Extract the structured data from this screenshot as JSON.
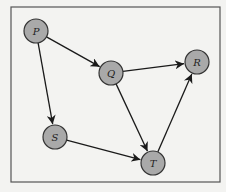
{
  "diagram": {
    "type": "directed-graph",
    "frame": {
      "x": 11,
      "y": 7,
      "width": 209,
      "height": 175,
      "stroke": "#555555"
    },
    "style": {
      "node_fill": "#a9a9a9",
      "node_stroke": "#333333",
      "edge_color": "#1a1a1a",
      "background": "#f3f3f1",
      "node_radius": 12
    },
    "nodes": [
      {
        "id": "P",
        "label": "P",
        "x": 36,
        "y": 31
      },
      {
        "id": "Q",
        "label": "Q",
        "x": 111,
        "y": 73
      },
      {
        "id": "R",
        "label": "R",
        "x": 197,
        "y": 62
      },
      {
        "id": "S",
        "label": "S",
        "x": 55,
        "y": 137
      },
      {
        "id": "T",
        "label": "T",
        "x": 153,
        "y": 163
      }
    ],
    "edges": [
      {
        "from": "P",
        "to": "Q"
      },
      {
        "from": "P",
        "to": "S"
      },
      {
        "from": "Q",
        "to": "R"
      },
      {
        "from": "Q",
        "to": "T"
      },
      {
        "from": "S",
        "to": "T"
      },
      {
        "from": "T",
        "to": "R"
      }
    ]
  }
}
